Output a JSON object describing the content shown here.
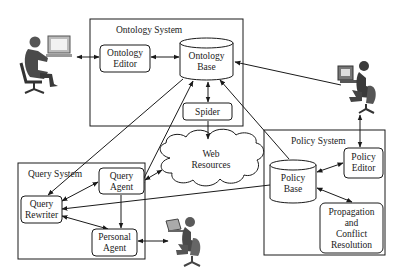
{
  "systems": {
    "ontology": {
      "title": "Ontology System"
    },
    "query": {
      "title": "Query System"
    },
    "policy": {
      "title": "Policy System"
    }
  },
  "components": {
    "ontology_editor": {
      "line1": "Ontology",
      "line2": "Editor"
    },
    "ontology_base": {
      "line1": "Ontology",
      "line2": "Base"
    },
    "spider": {
      "label": "Spider"
    },
    "web_resources": {
      "line1": "Web",
      "line2": "Resources"
    },
    "query_agent": {
      "line1": "Query",
      "line2": "Agent"
    },
    "query_rewriter": {
      "line1": "Query",
      "line2": "Rewriter"
    },
    "personal_agent": {
      "line1": "Personal",
      "line2": "Agent"
    },
    "policy_editor": {
      "line1": "Policy",
      "line2": "Editor"
    },
    "policy_base": {
      "line1": "Policy",
      "line2": "Base"
    },
    "propagation": {
      "line1": "Propagation",
      "line2": "and",
      "line3": "Conflict",
      "line4": "Resolution"
    }
  },
  "actors": [
    {
      "id": "ontology-user",
      "role": "user at desktop computer (left)"
    },
    {
      "id": "policy-user",
      "role": "user at desktop computer (right)"
    },
    {
      "id": "query-user",
      "role": "user at laptop (bottom)"
    }
  ],
  "colors": {
    "stroke": "#1a1a1a",
    "figure": "#4a4a4a",
    "background": "#ffffff"
  }
}
